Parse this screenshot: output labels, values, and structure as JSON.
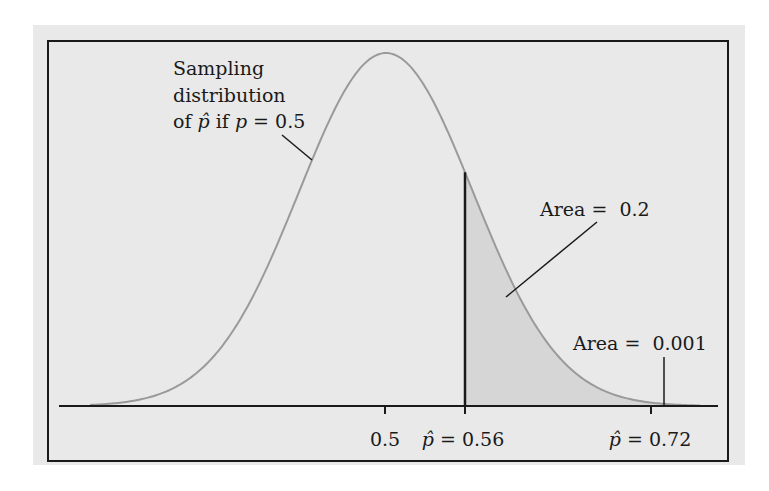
{
  "chart_data": {
    "type": "area",
    "title": "",
    "xlabel": "",
    "ylabel": "",
    "distribution": {
      "kind": "normal",
      "mean": 0.5,
      "description": "Sampling distribution of p-hat if p = 0.5"
    },
    "grid": false,
    "legend": null,
    "x_ticks": [
      {
        "value": 0.5,
        "label": "0.5"
      },
      {
        "value": 0.56,
        "label_prefix": "p̂",
        "label": " = 0.56"
      },
      {
        "value": 0.72,
        "label_prefix": "p̂",
        "label": " = 0.72"
      }
    ],
    "shaded_region": {
      "from": 0.56,
      "to": "tail",
      "area": 0.2
    },
    "marker_line": {
      "x": 0.56,
      "style": "vertical solid black"
    },
    "annotations": [
      {
        "id": "curve_label",
        "lines": [
          "Sampling",
          "distribution",
          "of p̂ if p = 0.5"
        ],
        "points_to": "curve left flank"
      },
      {
        "id": "area_mid",
        "text": "Area = ",
        "value": "0.2",
        "points_to": "shaded region right of 0.56"
      },
      {
        "id": "area_tail",
        "text": "Area = ",
        "value": "0.001",
        "points_to": "tail at 0.72"
      }
    ]
  },
  "labels": {
    "curve_line1": "Sampling",
    "curve_line2": "distribution",
    "curve_line3_a": "of ",
    "curve_line3_phat": "p̂",
    "curve_line3_b": " if ",
    "curve_line3_p": "p",
    "curve_line3_c": " = 0.5",
    "area1_text": "Area = ",
    "area1_value": "0.2",
    "area2_text": "Area = ",
    "area2_value": "0.001",
    "tick1": "0.5",
    "tick2_phat": "p̂",
    "tick2_rest": " = 0.56",
    "tick3_phat": "p̂",
    "tick3_rest": " = 0.72"
  },
  "geometry": {
    "peak_x": 386,
    "peak_y": 53,
    "baseline_y": 406,
    "sigma_px": 87,
    "axis_x1": 59,
    "axis_x2": 718,
    "tick_xs": [
      385,
      465,
      651
    ],
    "cut_x": 465,
    "curve_x1": 90,
    "curve_x2": 700
  },
  "colors": {
    "page_bg": "#ffffff",
    "panel_bg": "#e9e9e9",
    "frame": "#1a1a1a",
    "curve": "#9a9a9a",
    "shade": "#d6d6d6",
    "axis": "#1a1a1a"
  }
}
